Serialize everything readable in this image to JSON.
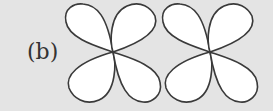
{
  "figure": {
    "label": "(b)",
    "colors": {
      "background": "#e4e4e4",
      "lobe_fill": "#ffffff",
      "lobe_stroke": "#3a3a3a"
    },
    "clovers": [
      {
        "name": "left-clover",
        "center": [
          113,
          52
        ],
        "lobes": 4
      },
      {
        "name": "right-clover",
        "center": [
          210,
          52
        ],
        "lobes": 4
      }
    ]
  }
}
